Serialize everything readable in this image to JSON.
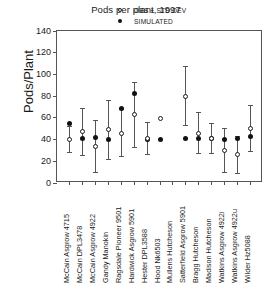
{
  "chart_data": {
    "type": "scatter",
    "title": "Pods per plant, 1997",
    "xlabel": "",
    "ylabel": "Pods/Plant",
    "ylim": [
      0,
      140
    ],
    "yticks": [
      0,
      20,
      40,
      60,
      80,
      100,
      120,
      140
    ],
    "grid": false,
    "legend_position": "top-right",
    "legend": [
      {
        "label": "OBS ± STD DEV",
        "marker": "open-circle"
      },
      {
        "label": "SIMULATED",
        "marker": "filled-circle"
      }
    ],
    "categories": [
      "McCain Asgrow 4715",
      "McCain DPL3478",
      "McCain Asgrow 4922",
      "Gandy Manokin",
      "Ragsdale Pioneer 9501",
      "Hardwick Asgrow 5901",
      "Hester DPL3588",
      "Hood Nk6503",
      "Mullens Hutcheson",
      "Satterfield Asgrow 5901",
      "Bragg Hutcheson",
      "Madison Hutcheson",
      "Watkins Asgrow 4922i",
      "Watkins Asgrow 4922u",
      "Wilder Hz5088"
    ],
    "series": [
      {
        "name": "OBS ± STD DEV",
        "marker": "open-circle",
        "values": [
          40,
          47,
          34,
          49,
          46,
          63,
          41,
          59,
          null,
          80,
          46,
          41,
          30,
          26,
          50
        ],
        "errors": [
          12,
          22,
          24,
          27,
          22,
          30,
          15,
          null,
          null,
          27,
          19,
          14,
          20,
          17,
          21
        ]
      },
      {
        "name": "SIMULATED",
        "marker": "filled-circle",
        "values": [
          55,
          41,
          42,
          40,
          69,
          82,
          40,
          40,
          null,
          41,
          41,
          41,
          40,
          41,
          43
        ],
        "errors": [
          null,
          null,
          null,
          null,
          null,
          null,
          null,
          null,
          null,
          null,
          null,
          null,
          null,
          null,
          null
        ]
      }
    ]
  },
  "axes": {
    "y_tick_labels": [
      "140",
      "120",
      "100",
      "80",
      "60",
      "40",
      "20",
      "0"
    ]
  }
}
